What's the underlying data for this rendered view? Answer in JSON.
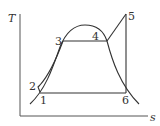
{
  "diagram": {
    "type": "T-s diagram (Rankine cycle with superheat)",
    "axes": {
      "y_label": "T",
      "x_label": "s"
    },
    "points": [
      {
        "id": "1",
        "label": "1",
        "x": 40,
        "y": 92
      },
      {
        "id": "2",
        "label": "2",
        "x": 39,
        "y": 86
      },
      {
        "id": "3",
        "label": "3",
        "x": 63,
        "y": 41
      },
      {
        "id": "4",
        "label": "4",
        "x": 107,
        "y": 41
      },
      {
        "id": "5",
        "label": "5",
        "x": 126,
        "y": 14
      },
      {
        "id": "6",
        "label": "6",
        "x": 126,
        "y": 92
      }
    ],
    "processes": [
      {
        "from": "1",
        "to": "2",
        "kind": "pump compression"
      },
      {
        "from": "2",
        "to": "3",
        "kind": "liquid heating"
      },
      {
        "from": "3",
        "to": "4",
        "kind": "evaporation (isothermal)"
      },
      {
        "from": "4",
        "to": "5",
        "kind": "superheating"
      },
      {
        "from": "5",
        "to": "6",
        "kind": "isentropic expansion"
      },
      {
        "from": "6",
        "to": "1",
        "kind": "condensation (isothermal)"
      }
    ],
    "colors": {
      "line": "#333333",
      "axis": "#555555",
      "background": "#ffffff"
    }
  }
}
